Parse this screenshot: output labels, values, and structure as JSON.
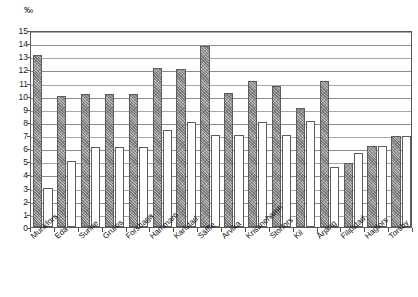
{
  "axis": {
    "y_unit_label": "‰",
    "y_ticks": [
      "15",
      "14",
      "13",
      "12",
      "11",
      "10",
      "9",
      "8",
      "7",
      "6",
      "5",
      "4",
      "3",
      "2",
      "1",
      "0"
    ]
  },
  "chart_data": {
    "type": "bar",
    "title": "",
    "subtitle": "",
    "xlabel": "",
    "ylabel": "‰",
    "ylim": [
      0,
      15
    ],
    "ytick_step": 1,
    "grid": true,
    "legend": "none",
    "orientation": "vertical",
    "grouping": "paired",
    "categories": [
      "Munkfors",
      "Eda",
      "Sunne",
      "Grums",
      "Forshaga",
      "Hammarö",
      "Karlstad",
      "Säffle",
      "Arvika",
      "Kristinehamn",
      "Storfors",
      "Kil",
      "Årjäng",
      "Filipstad",
      "Hagfors",
      "Torsby"
    ],
    "series": [
      {
        "name": "series-a",
        "style": "shaded",
        "values": [
          13.1,
          10.0,
          10.1,
          10.1,
          10.1,
          12.1,
          12.0,
          13.8,
          10.2,
          11.1,
          10.7,
          9.1,
          11.1,
          4.9,
          6.2,
          6.9
        ]
      },
      {
        "name": "series-b",
        "style": "white",
        "values": [
          3.0,
          5.0,
          6.1,
          6.1,
          6.1,
          7.4,
          8.0,
          7.0,
          7.0,
          8.0,
          7.0,
          8.1,
          4.6,
          5.6,
          6.2,
          6.9
        ]
      }
    ]
  }
}
